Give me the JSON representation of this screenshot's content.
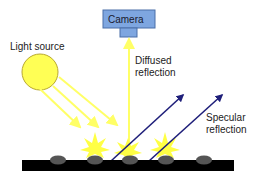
{
  "diagram": {
    "labels": {
      "light_source": "Light source",
      "camera": "Camera",
      "diffused_line1": "Diffused",
      "diffused_line2": "reflection",
      "specular_line1": "Specular",
      "specular_line2": "reflection"
    },
    "colors": {
      "sun_fill": "#ffff55",
      "sun_stroke": "#b8a830",
      "light_ray": "#ffff66",
      "camera_fill": "#7ea6e0",
      "camera_stroke": "#4a6fa8",
      "specular_ray": "#1f1f7a",
      "surface": "#000000",
      "particle": "#555555",
      "burst": "#ffff44"
    }
  }
}
